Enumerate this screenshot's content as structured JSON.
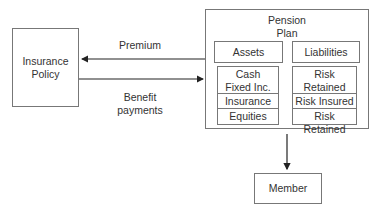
{
  "nodes": {
    "insurance_policy": {
      "label_line1": "Insurance",
      "label_line2": "Policy"
    },
    "pension_plan": {
      "label_line1": "Pension",
      "label_line2": "Plan",
      "assets_header": "Assets",
      "liabilities_header": "Liabilities",
      "assets": [
        {
          "line1": "Cash",
          "line2": "Fixed Inc."
        },
        {
          "line1": "Insurance"
        },
        {
          "line1": "Equities"
        }
      ],
      "liabilities": [
        {
          "line1": "Risk Retained"
        },
        {
          "line1": "Risk Insured"
        },
        {
          "line1": "Risk Retained"
        }
      ]
    },
    "member": {
      "label": "Member"
    }
  },
  "edges": [
    {
      "from": "pension_plan",
      "to": "insurance_policy",
      "label": "Premium"
    },
    {
      "from": "insurance_policy",
      "to": "pension_plan",
      "label_line1": "Benefit",
      "label_line2": "payments"
    },
    {
      "from": "pension_plan",
      "to": "member",
      "label": ""
    }
  ],
  "colors": {
    "stroke": "#777777",
    "arrow": "#222222",
    "text": "#333333"
  }
}
